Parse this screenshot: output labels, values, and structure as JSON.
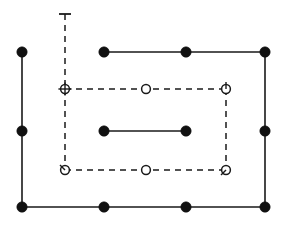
{
  "figure": {
    "width": 282,
    "height": 226,
    "background_color": "#ffffff",
    "line_color": "#1a1a1a",
    "node_fill_solid": "#111111",
    "node_fill_open": "#ffffff",
    "solid_stroke_width": 1.6,
    "dashed_stroke_width": 1.5,
    "dash_pattern": "6 5"
  },
  "solid_polyline_outer": {
    "name": "outer-solid-path",
    "comment": "Open C-shaped path: starts top-left, goes down left side, across the bottom, and up the right side to the top-right, then left along the top.",
    "points": [
      {
        "x": 22,
        "y": 52
      },
      {
        "x": 22,
        "y": 207
      },
      {
        "x": 265,
        "y": 207
      },
      {
        "x": 265,
        "y": 52
      },
      {
        "x": 104,
        "y": 52
      }
    ]
  },
  "solid_segment_inner": {
    "name": "inner-solid-segment",
    "points": [
      {
        "x": 104,
        "y": 131
      },
      {
        "x": 186,
        "y": 131
      }
    ]
  },
  "dashed_rectangle": {
    "name": "dashed-rectangle",
    "x1": 65,
    "y1": 89,
    "x2": 226,
    "y2": 170
  },
  "dashed_stem": {
    "name": "dashed-vertical-stem",
    "x": 65,
    "y_top": 14,
    "y_bottom": 89,
    "cap": {
      "type": "t-cap",
      "half_width": 6,
      "y": 14
    }
  },
  "solid_nodes": [
    {
      "id": "n1",
      "label": "top-left-corner",
      "x": 22,
      "y": 52,
      "r": 5.2
    },
    {
      "id": "n2",
      "label": "left-mid",
      "x": 22,
      "y": 131,
      "r": 5.2
    },
    {
      "id": "n3",
      "label": "bottom-left-corner",
      "x": 22,
      "y": 207,
      "r": 5.2
    },
    {
      "id": "n4",
      "label": "bottom-mid-left",
      "x": 104,
      "y": 207,
      "r": 5.2
    },
    {
      "id": "n5",
      "label": "bottom-mid-right",
      "x": 186,
      "y": 207,
      "r": 5.2
    },
    {
      "id": "n6",
      "label": "bottom-right-corner",
      "x": 265,
      "y": 207,
      "r": 5.2
    },
    {
      "id": "n7",
      "label": "right-mid",
      "x": 265,
      "y": 131,
      "r": 5.2
    },
    {
      "id": "n8",
      "label": "top-right-corner",
      "x": 265,
      "y": 52,
      "r": 5.2
    },
    {
      "id": "n9",
      "label": "top-mid-right",
      "x": 186,
      "y": 52,
      "r": 5.2
    },
    {
      "id": "n10",
      "label": "top-mid-left",
      "x": 104,
      "y": 52,
      "r": 5.2
    },
    {
      "id": "n11",
      "label": "inner-segment-left",
      "x": 104,
      "y": 131,
      "r": 5.2
    },
    {
      "id": "n12",
      "label": "inner-segment-right",
      "x": 186,
      "y": 131,
      "r": 5.2
    }
  ],
  "open_nodes": [
    {
      "id": "o1",
      "label": "dashed-top-left-crossed",
      "marker": "crossed-circle",
      "x": 65,
      "y": 89,
      "r": 4.4,
      "tick": null
    },
    {
      "id": "o2",
      "label": "dashed-top-mid",
      "marker": "open-circle",
      "x": 146,
      "y": 89,
      "r": 4.4,
      "tick": null
    },
    {
      "id": "o3",
      "label": "dashed-top-right",
      "marker": "open-circle-tick",
      "x": 226,
      "y": 89,
      "r": 4.4,
      "tick": {
        "dx": 0,
        "dy": -7
      }
    },
    {
      "id": "o4",
      "label": "dashed-bottom-left",
      "marker": "open-circle-tick",
      "x": 65,
      "y": 170,
      "r": 4.4,
      "tick": {
        "dx": -5,
        "dy": -5
      }
    },
    {
      "id": "o5",
      "label": "dashed-bottom-mid",
      "marker": "open-circle",
      "x": 146,
      "y": 170,
      "r": 4.4,
      "tick": null
    },
    {
      "id": "o6",
      "label": "dashed-bottom-right",
      "marker": "open-circle-tick",
      "x": 226,
      "y": 170,
      "r": 4.4,
      "tick": {
        "dx": -5,
        "dy": 5
      }
    }
  ]
}
